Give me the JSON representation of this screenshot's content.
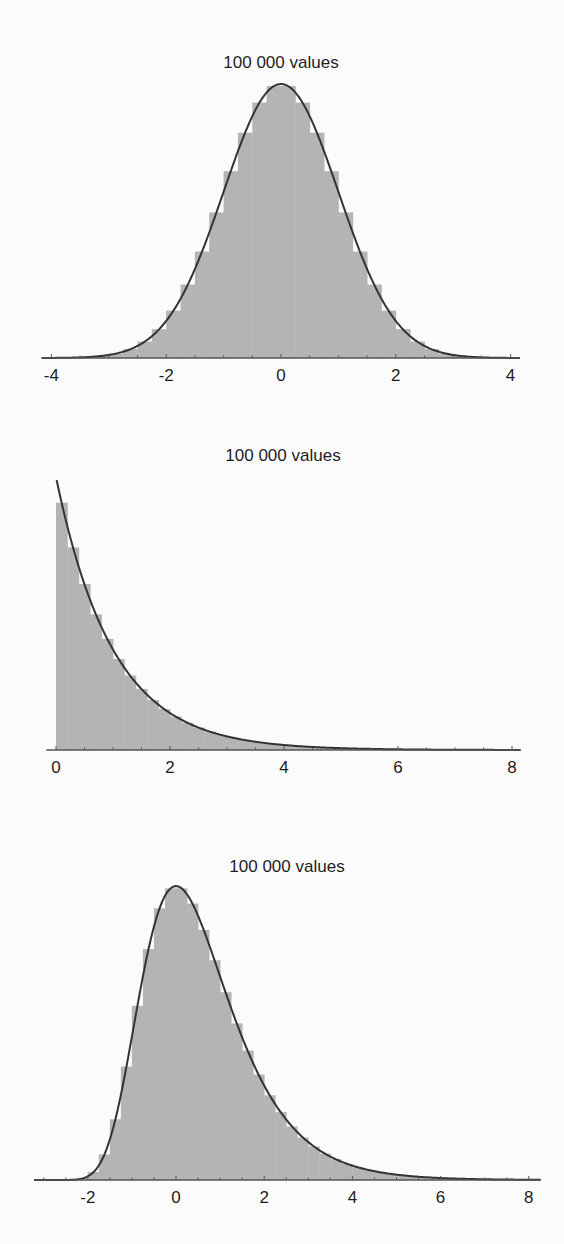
{
  "chart_data": [
    {
      "type": "bar",
      "subtype": "histogram_with_density_curve",
      "title": "100 000 values",
      "distribution": "normal",
      "xlabel": "",
      "ylabel": "",
      "xlim": [
        -4.17,
        4.16
      ],
      "ylim": [
        0,
        0.41
      ],
      "grid": false,
      "legend": null,
      "x_ticks": [
        -4,
        -2,
        0,
        2,
        4
      ],
      "x_tick_labels": [
        "-4",
        "-2",
        "0",
        "2",
        "4"
      ],
      "minor_tick_step": 0.5,
      "bin_start": -4,
      "bin_width": 0.25,
      "bin_values": [
        0.0,
        0.001,
        0.001,
        0.003,
        0.006,
        0.013,
        0.024,
        0.042,
        0.069,
        0.107,
        0.155,
        0.212,
        0.272,
        0.328,
        0.372,
        0.396,
        0.396,
        0.372,
        0.328,
        0.272,
        0.212,
        0.155,
        0.107,
        0.069,
        0.042,
        0.024,
        0.013,
        0.006,
        0.003,
        0.001,
        0.001,
        0.0
      ],
      "curve": {
        "name": "density",
        "formula": "exp(-x^2/2)/sqrt(2*pi)",
        "x_range": [
          -4.17,
          4.16
        ]
      }
    },
    {
      "type": "bar",
      "subtype": "histogram_with_density_curve",
      "title": "100 000 values",
      "distribution": "exponential",
      "xlabel": "",
      "ylabel": "",
      "xlim": [
        -0.17,
        8.15
      ],
      "ylim": [
        0,
        1.0
      ],
      "grid": false,
      "legend": null,
      "x_ticks": [
        0,
        2,
        4,
        6,
        8
      ],
      "x_tick_labels": [
        "0",
        "2",
        "4",
        "6",
        "8"
      ],
      "minor_tick_step": 0.5,
      "bin_start": 0,
      "bin_width": 0.2,
      "bin_values": [
        0.906,
        0.742,
        0.608,
        0.497,
        0.407,
        0.333,
        0.273,
        0.224,
        0.183,
        0.15,
        0.123,
        0.1,
        0.082,
        0.067,
        0.055,
        0.045,
        0.037,
        0.03,
        0.025,
        0.02,
        0.017,
        0.014,
        0.011,
        0.009,
        0.007,
        0.006,
        0.005,
        0.004,
        0.003,
        0.003,
        0.002,
        0.002,
        0.002,
        0.001,
        0.001,
        0.001,
        0.001,
        0.001,
        0.0,
        0.0
      ],
      "curve": {
        "name": "density",
        "formula": "exp(-x)",
        "x_range": [
          -0.05,
          8.15
        ]
      }
    },
    {
      "type": "bar",
      "subtype": "histogram_with_density_curve",
      "title": "100 000 values",
      "distribution": "gumbel",
      "xlabel": "",
      "ylabel": "",
      "xlim": [
        -3.22,
        8.27
      ],
      "ylim": [
        0,
        0.37
      ],
      "grid": false,
      "legend": null,
      "x_ticks": [
        -2,
        0,
        2,
        4,
        6,
        8
      ],
      "x_tick_labels": [
        "-2",
        "0",
        "2",
        "4",
        "6",
        "8"
      ],
      "minor_tick_step": 0.5,
      "bin_start": -3,
      "bin_width": 0.25,
      "bin_values": [
        0.0,
        0.0,
        0.0,
        0.002,
        0.01,
        0.032,
        0.076,
        0.142,
        0.218,
        0.289,
        0.34,
        0.365,
        0.365,
        0.346,
        0.313,
        0.275,
        0.235,
        0.196,
        0.162,
        0.132,
        0.106,
        0.085,
        0.067,
        0.053,
        0.042,
        0.033,
        0.026,
        0.02,
        0.016,
        0.012,
        0.01,
        0.008,
        0.006,
        0.005,
        0.004,
        0.003,
        0.002,
        0.002,
        0.001,
        0.001,
        0.001,
        0.001,
        0.001,
        0.0
      ],
      "curve": {
        "name": "density",
        "formula": "exp(-x - exp(-x))",
        "x_range": [
          -3.22,
          8.27
        ]
      }
    }
  ],
  "colors": {
    "background": "#fbfbfb",
    "bar_fill": "#b4b4b4",
    "curve": "#333333",
    "axis": "#555555",
    "text": "#1e1e1e"
  }
}
